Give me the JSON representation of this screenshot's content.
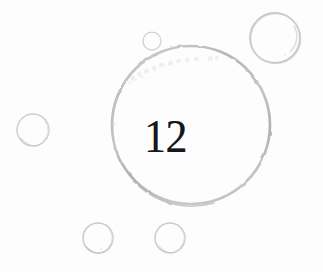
{
  "page": {
    "kind": "chapter-number-illustration",
    "background_color": "#fdfdfd",
    "width": 323,
    "height": 272
  },
  "chapter": {
    "number": "12",
    "number_color": "#17171a",
    "font_style": "serif"
  },
  "ghost_text": {
    "visible": true,
    "legible": false,
    "content": "",
    "color": "#c9c9cd",
    "note": "faint show-through marks, illegible"
  },
  "palette": {
    "stroke_light": "#d4d4d6",
    "stroke_mid": "#c0c0c3",
    "stroke_dark": "#a9a9ad",
    "highlight": "#e6e6e8",
    "background": "#fdfdfd",
    "ink": "#17171a"
  },
  "circles": [
    {
      "id": "main-circle",
      "label": "main chapter circle",
      "cx": 191,
      "cy": 125,
      "r": 79,
      "stroke_width": 2.6,
      "stroke": "#b9b9bd",
      "has_highlight": false
    },
    {
      "id": "bubble-top-right-large",
      "label": "large bubble upper right",
      "cx": 275,
      "cy": 38,
      "r": 25,
      "stroke_width": 1.6,
      "stroke": "#cbcbce",
      "has_highlight": true
    },
    {
      "id": "bubble-top-small",
      "label": "small bubble atop main circle",
      "cx": 152,
      "cy": 41,
      "r": 9,
      "stroke_width": 1.2,
      "stroke": "#d2d2d5",
      "has_highlight": true
    },
    {
      "id": "bubble-left",
      "label": "bubble at left edge",
      "cx": 33,
      "cy": 130,
      "r": 16,
      "stroke_width": 1.3,
      "stroke": "#d0d0d3",
      "has_highlight": true
    },
    {
      "id": "bubble-bottom-left",
      "label": "bubble lower left",
      "cx": 98,
      "cy": 238,
      "r": 15,
      "stroke_width": 1.4,
      "stroke": "#cdcdd0",
      "has_highlight": true
    },
    {
      "id": "bubble-bottom-right",
      "label": "bubble lower middle",
      "cx": 170,
      "cy": 238,
      "r": 15,
      "stroke_width": 1.4,
      "stroke": "#cdcdd0",
      "has_highlight": true
    }
  ]
}
